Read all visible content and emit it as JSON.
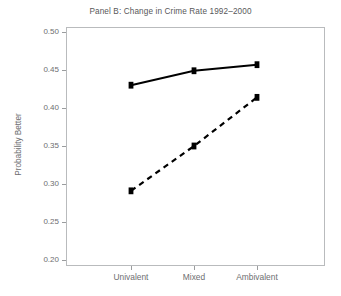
{
  "chart_data": {
    "type": "line",
    "title": "Panel B: Change in Crime Rate 1992–2000",
    "xlabel": "",
    "ylabel": "Probability Better",
    "categories": [
      "Univalent",
      "Mixed",
      "Ambivalent"
    ],
    "ylim": [
      0.2,
      0.5
    ],
    "ytick_step": 0.05,
    "ytick_labels": [
      "0.50",
      "0.45",
      "0.40",
      "0.35",
      "0.30",
      "0.25",
      "0.20"
    ],
    "ytick_values": [
      0.5,
      0.45,
      0.4,
      0.35,
      0.3,
      0.25,
      0.2
    ],
    "grid": false,
    "legend": "none",
    "series": [
      {
        "name": "solid-series",
        "style": "solid",
        "color": "#000000",
        "marker": "square",
        "values": [
          0.43,
          0.449,
          0.457
        ]
      },
      {
        "name": "dashed-series",
        "style": "dashed",
        "color": "#000000",
        "marker": "square",
        "values": [
          0.291,
          0.35,
          0.414
        ]
      }
    ]
  },
  "figure": {
    "title": "Panel B: Change in Crime Rate 1992–2000",
    "ylabel": "Probability Better",
    "background": "#ffffff",
    "axis_color": "#b9bbbd",
    "text_color": "#6d6e70"
  }
}
